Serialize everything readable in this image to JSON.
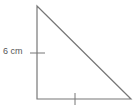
{
  "diagram": {
    "type": "right-triangle",
    "side_label": "6 cm",
    "equal_legs_marked": true,
    "line_color": "#777777",
    "vertices": {
      "top": [
        37,
        6
      ],
      "bottom_left": [
        37,
        99
      ],
      "bottom_right": [
        131,
        99
      ]
    }
  }
}
